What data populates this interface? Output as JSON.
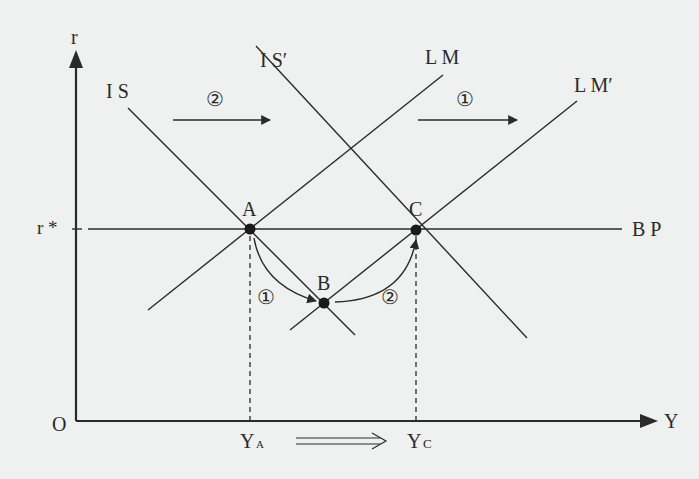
{
  "diagram": {
    "type": "IS-LM-BP",
    "axes": {
      "y_label": "r",
      "x_label": "Y",
      "origin_label": "O",
      "r_star_label": "r *"
    },
    "curves": {
      "is": "I S",
      "is_prime": "I S′",
      "lm": "L M",
      "lm_prime": "L M′",
      "bp": "B P"
    },
    "points": {
      "a": "A",
      "b": "B",
      "c": "C"
    },
    "shift_arrows": {
      "is_shift_step": "②",
      "lm_shift_step": "①"
    },
    "path_steps": {
      "a_to_b": "①",
      "b_to_c": "②"
    },
    "x_ticks": {
      "ya_main": "Y",
      "ya_sub": "A",
      "yc_main": "Y",
      "yc_sub": "C"
    },
    "colors": {
      "background": "#eef1ef",
      "ink": "#2a2a2a"
    }
  }
}
